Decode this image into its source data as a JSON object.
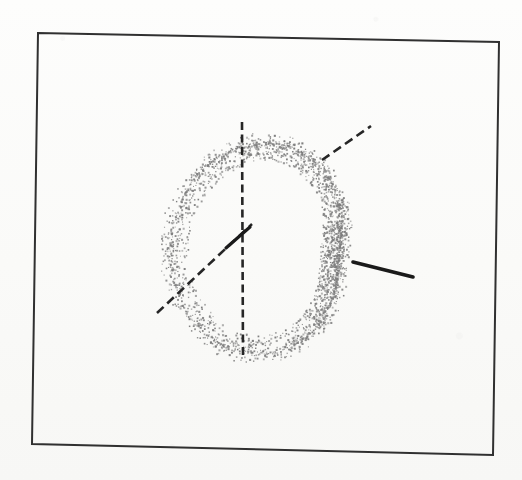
{
  "figure": {
    "kind": "scanned-line-drawing",
    "background_color": "#fbfbfa",
    "ink_color": "#2b2b2b",
    "stipple_color": "#7d7d7d",
    "caption": "",
    "title": ""
  },
  "frame": {
    "name": "figure-border",
    "stroke_color": "#303030",
    "stroke_width": 2,
    "corners": {
      "top_left": [
        38,
        33
      ],
      "top_right": [
        499,
        42
      ],
      "bottom_right": [
        493,
        455
      ],
      "bottom_left": [
        32,
        444
      ]
    }
  },
  "chart_data": {
    "type": "scatter",
    "title": "",
    "subtitle": "",
    "xlabel": "",
    "ylabel": "",
    "grid": false,
    "legend": "none",
    "xlim": [
      38,
      499
    ],
    "ylim": [
      33,
      455
    ],
    "curve": {
      "name": "limacon-stipple-band",
      "description": "stippled limacon with inner loop",
      "render": "stipple",
      "dot_color": "#7d7d7d",
      "dot_size": 1.4,
      "dot_count": 2600,
      "band_width": 19,
      "parametric": {
        "form": "r = a + b*cos(t)",
        "a": 86,
        "b": 46,
        "center": [
          300,
          252
        ],
        "rotation_deg": 186,
        "x_scale": 1.0,
        "y_scale": 1.12
      },
      "outer_loop_bbox": [
        246,
        150,
        374,
        360
      ],
      "inner_loop_bbox": [
        172,
        178,
        246,
        242
      ],
      "node_point": [
        245,
        228
      ]
    },
    "annotations": [
      {
        "name": "vertical-axis-line",
        "style": "dashed",
        "stroke_color": "#262626",
        "stroke_width": 2.6,
        "dash": [
          8,
          4.5
        ],
        "x1": 242,
        "y1": 122,
        "x2": 243,
        "y2": 358
      },
      {
        "name": "oblique-axis-line",
        "style": "dashed",
        "stroke_color": "#262626",
        "stroke_width": 2.6,
        "dash": [
          9,
          5
        ],
        "x1": 157,
        "y1": 313,
        "x2": 252,
        "y2": 224
      },
      {
        "name": "upper-right-tangent-line",
        "style": "dashed",
        "stroke_color": "#262626",
        "stroke_width": 2.6,
        "dash": [
          9,
          5
        ],
        "x1": 322,
        "y1": 160,
        "x2": 371,
        "y2": 126
      },
      {
        "name": "right-pointer-line",
        "style": "solid",
        "stroke_color": "#1a1a1a",
        "stroke_width": 3.6,
        "x1": 353,
        "y1": 262,
        "x2": 413,
        "y2": 277
      },
      {
        "name": "node-pointer-stub",
        "style": "solid",
        "stroke_color": "#1a1a1a",
        "stroke_width": 3.2,
        "x1": 226,
        "y1": 248,
        "x2": 250,
        "y2": 227
      }
    ]
  }
}
